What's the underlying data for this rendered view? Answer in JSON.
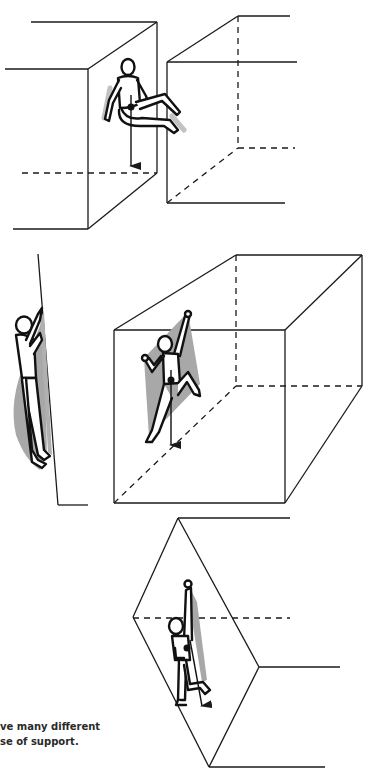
{
  "caption": {
    "line1": "ve many different",
    "line2": "se of support."
  },
  "colors": {
    "line": "#1a1a1a",
    "shadow": "#a8a8a8",
    "background": "#ffffff"
  },
  "panels": [
    {
      "id": "panel-1",
      "description": "climber bridging between two blocks, seated posture, centre of mass arrow pointing down",
      "objects": [
        "left-block",
        "right-block",
        "climber-figure",
        "center-of-mass-dot",
        "gravity-arrow"
      ]
    },
    {
      "id": "panel-2",
      "description": "side view climber on slab and front view climber on open box wall with support triangle shading",
      "objects": [
        "slab-wall",
        "side-climber",
        "box",
        "climber-figure",
        "support-polygon-shading",
        "gravity-arrow"
      ]
    },
    {
      "id": "panel-3",
      "description": "climber hanging on rhombic arete face, single handhold, gravity arrow",
      "objects": [
        "rhombic-face",
        "climber-figure",
        "gravity-arrow"
      ]
    }
  ]
}
